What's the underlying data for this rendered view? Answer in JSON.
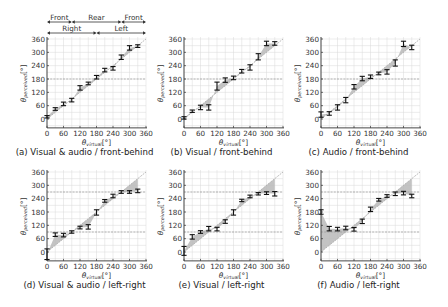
{
  "figure": {
    "y_axis_label": "θ_perceived[°]",
    "x_axis_label": "θ_virtual[°]",
    "region_labels": {
      "front_behind": [
        "Front",
        "Rear",
        "Front"
      ],
      "left_right": [
        "Right",
        "Left"
      ]
    }
  },
  "chart_data": [
    {
      "id": "a",
      "type": "scatter",
      "title": "(a) Visual & audio / front-behind",
      "xlabel": "θ_virtual[°]",
      "ylabel": "θ_perceived[°]",
      "xlim": [
        0,
        360
      ],
      "ylim": [
        -40,
        360
      ],
      "xticks": [
        0,
        60,
        120,
        180,
        240,
        300,
        360
      ],
      "yticks": [
        0,
        60,
        120,
        180,
        240,
        300,
        360
      ],
      "grid": true,
      "reference_lines": [
        180
      ],
      "x": [
        0,
        30,
        60,
        90,
        120,
        150,
        180,
        210,
        240,
        270,
        300,
        330
      ],
      "y": [
        10,
        45,
        68,
        85,
        140,
        160,
        188,
        220,
        228,
        278,
        320,
        328
      ],
      "error": [
        4,
        6,
        8,
        8,
        10,
        6,
        8,
        8,
        8,
        10,
        10,
        6
      ]
    },
    {
      "id": "b",
      "type": "scatter",
      "title": "(b) Visual / front-behind",
      "xlabel": "θ_virtual[°]",
      "ylabel": "θ_perceived[°]",
      "xlim": [
        0,
        360
      ],
      "ylim": [
        -40,
        360
      ],
      "xticks": [
        0,
        60,
        120,
        180,
        240,
        300,
        360
      ],
      "yticks": [
        0,
        60,
        120,
        180,
        240,
        300,
        360
      ],
      "grid": true,
      "reference_lines": [
        180
      ],
      "x": [
        0,
        30,
        60,
        90,
        120,
        150,
        180,
        210,
        240,
        270,
        300,
        330
      ],
      "y": [
        5,
        35,
        52,
        52,
        148,
        175,
        185,
        215,
        232,
        280,
        340,
        340
      ],
      "error": [
        3,
        4,
        10,
        12,
        18,
        10,
        8,
        8,
        12,
        14,
        10,
        8
      ]
    },
    {
      "id": "c",
      "type": "scatter",
      "title": "(c) Audio / front-behind",
      "xlabel": "θ_virtual[°]",
      "ylabel": "θ_perceived[°]",
      "xlim": [
        0,
        360
      ],
      "ylim": [
        -40,
        360
      ],
      "xticks": [
        0,
        60,
        120,
        180,
        240,
        300,
        360
      ],
      "yticks": [
        0,
        60,
        120,
        180,
        240,
        300,
        360
      ],
      "grid": true,
      "reference_lines": [
        180
      ],
      "x": [
        0,
        30,
        60,
        90,
        120,
        150,
        180,
        210,
        240,
        270,
        300,
        330
      ],
      "y": [
        20,
        25,
        52,
        85,
        145,
        182,
        190,
        205,
        212,
        252,
        338,
        322
      ],
      "error": [
        12,
        8,
        12,
        12,
        10,
        10,
        8,
        6,
        10,
        14,
        12,
        10
      ]
    },
    {
      "id": "d",
      "type": "scatter",
      "title": "(d) Visual & audio / left-right",
      "xlabel": "θ_virtual[°]",
      "ylabel": "θ_perceived[°]",
      "xlim": [
        0,
        360
      ],
      "ylim": [
        -40,
        360
      ],
      "xticks": [
        0,
        60,
        120,
        180,
        240,
        300,
        360
      ],
      "yticks": [
        0,
        60,
        120,
        180,
        240,
        300,
        360
      ],
      "grid": true,
      "reference_lines": [
        90,
        270
      ],
      "x": [
        0,
        30,
        60,
        90,
        120,
        150,
        180,
        210,
        240,
        270,
        300,
        330
      ],
      "y": [
        -10,
        78,
        76,
        90,
        110,
        113,
        178,
        230,
        252,
        270,
        270,
        275
      ],
      "error": [
        24,
        8,
        8,
        4,
        6,
        10,
        12,
        6,
        8,
        6,
        6,
        8
      ]
    },
    {
      "id": "e",
      "type": "scatter",
      "title": "(e) Visual / left-right",
      "xlabel": "θ_virtual[°]",
      "ylabel": "θ_perceived[°]",
      "xlim": [
        0,
        360
      ],
      "ylim": [
        -40,
        360
      ],
      "xticks": [
        0,
        60,
        120,
        180,
        240,
        300,
        360
      ],
      "yticks": [
        0,
        60,
        120,
        180,
        240,
        300,
        360
      ],
      "grid": true,
      "reference_lines": [
        90,
        270
      ],
      "x": [
        0,
        30,
        60,
        90,
        120,
        150,
        180,
        210,
        240,
        270,
        300,
        330
      ],
      "y": [
        5,
        68,
        90,
        105,
        103,
        137,
        178,
        232,
        250,
        262,
        265,
        262
      ],
      "error": [
        20,
        10,
        6,
        10,
        8,
        8,
        12,
        4,
        6,
        4,
        6,
        10
      ]
    },
    {
      "id": "f",
      "type": "scatter",
      "title": "(f) Audio / left-right",
      "xlabel": "θ_virtual[°]",
      "ylabel": "θ_perceived[°]",
      "xlim": [
        0,
        360
      ],
      "ylim": [
        -40,
        360
      ],
      "xticks": [
        0,
        60,
        120,
        180,
        240,
        300,
        360
      ],
      "yticks": [
        0,
        60,
        120,
        180,
        240,
        300,
        360
      ],
      "grid": true,
      "reference_lines": [
        90,
        270
      ],
      "x": [
        0,
        30,
        60,
        90,
        120,
        150,
        180,
        210,
        240,
        270,
        300,
        330
      ],
      "y": [
        180,
        105,
        103,
        108,
        102,
        138,
        192,
        235,
        252,
        262,
        265,
        252
      ],
      "error": [
        10,
        10,
        8,
        8,
        8,
        10,
        10,
        6,
        6,
        8,
        8,
        8
      ]
    }
  ],
  "layout": {
    "panels": [
      {
        "left": 47,
        "top": 39,
        "width": 99,
        "zeroY": 119
      },
      {
        "left": 184,
        "top": 39,
        "width": 99,
        "zeroY": 119
      },
      {
        "left": 321,
        "top": 39,
        "width": 99,
        "zeroY": 119
      },
      {
        "left": 47,
        "top": 172,
        "width": 99,
        "zeroY": 252
      },
      {
        "left": 184,
        "top": 172,
        "width": 99,
        "zeroY": 252
      },
      {
        "left": 321,
        "top": 172,
        "width": 99,
        "zeroY": 252
      }
    ],
    "colors": {
      "grid": "#d9d9d9",
      "diagonal": "#aaaaaa",
      "shade": "#b8b8b8",
      "refline": "#9a9a9a",
      "marker": "#111111",
      "axis": "#333333"
    }
  }
}
